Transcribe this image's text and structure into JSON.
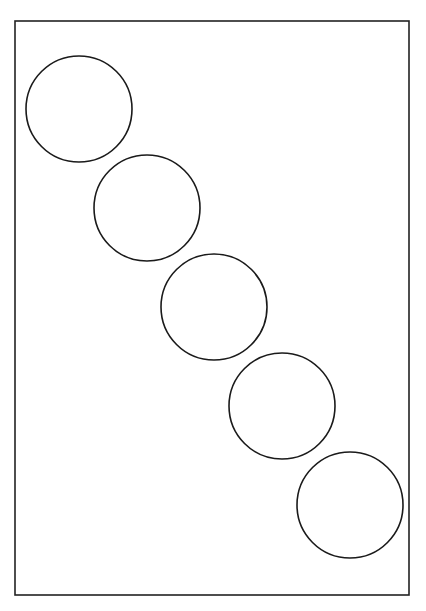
{
  "canvas": {
    "width": 426,
    "height": 611,
    "background": "#ffffff"
  },
  "frame": {
    "x": 15,
    "y": 21,
    "width": 394,
    "height": 574,
    "stroke": "#222222",
    "stroke_width": 1.6
  },
  "circles": [
    {
      "cx": 79,
      "cy": 109,
      "r": 53
    },
    {
      "cx": 147,
      "cy": 208,
      "r": 53
    },
    {
      "cx": 214,
      "cy": 307,
      "r": 53
    },
    {
      "cx": 282,
      "cy": 406,
      "r": 53
    },
    {
      "cx": 350,
      "cy": 505,
      "r": 53
    }
  ],
  "circle_style": {
    "stroke": "#1a1a1a",
    "stroke_width": 1.6,
    "fill": "none"
  }
}
